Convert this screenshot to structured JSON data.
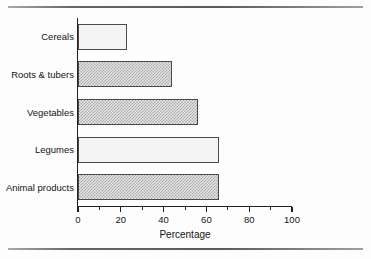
{
  "figure": {
    "background_color": "#fdfdfd",
    "rule_color": "#4a4a4a",
    "axis_color": "#222222",
    "bar_border_color": "#4a4a4a",
    "bar_fill_color": "#e3e3e3",
    "bar_fill_light_color": "#f4f4f4"
  },
  "chart_data": {
    "type": "bar",
    "orientation": "horizontal",
    "title": "",
    "subtitle": "",
    "xlabel": "Percentage",
    "ylabel": "",
    "categories": [
      "Cereals",
      "Roots & tubers",
      "Vegetables",
      "Legumes",
      "Animal products"
    ],
    "values": [
      23,
      44,
      56,
      66,
      66
    ],
    "series": [
      {
        "name": "Percentage",
        "values": [
          23,
          44,
          56,
          66,
          66
        ]
      }
    ],
    "xlim": [
      0,
      100
    ],
    "xticks": [
      0,
      20,
      40,
      60,
      80,
      100
    ],
    "xticklabels": [
      "0",
      "20",
      "40",
      "60",
      "80",
      "100"
    ],
    "minor_xticks": [
      10,
      30,
      50,
      70,
      90
    ],
    "grid": false,
    "legend": false,
    "legend_position": "none",
    "bar_styles": [
      "light",
      "dithered",
      "dithered",
      "light",
      "dithered"
    ],
    "annotations": []
  }
}
